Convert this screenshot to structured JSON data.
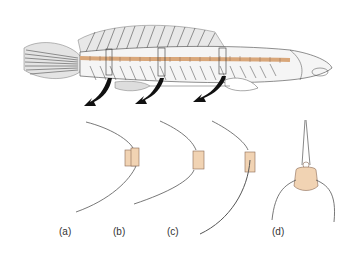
{
  "diagram": {
    "labels": [
      {
        "id": "a",
        "text": "(a)"
      },
      {
        "id": "b",
        "text": "(b)"
      },
      {
        "id": "c",
        "text": "(c)"
      },
      {
        "id": "d",
        "text": "(d)"
      }
    ],
    "colors": {
      "bone": "#f1d3b3",
      "bone_outline": "#8a6a55",
      "ink": "#222222",
      "arrow": "#111111"
    }
  }
}
